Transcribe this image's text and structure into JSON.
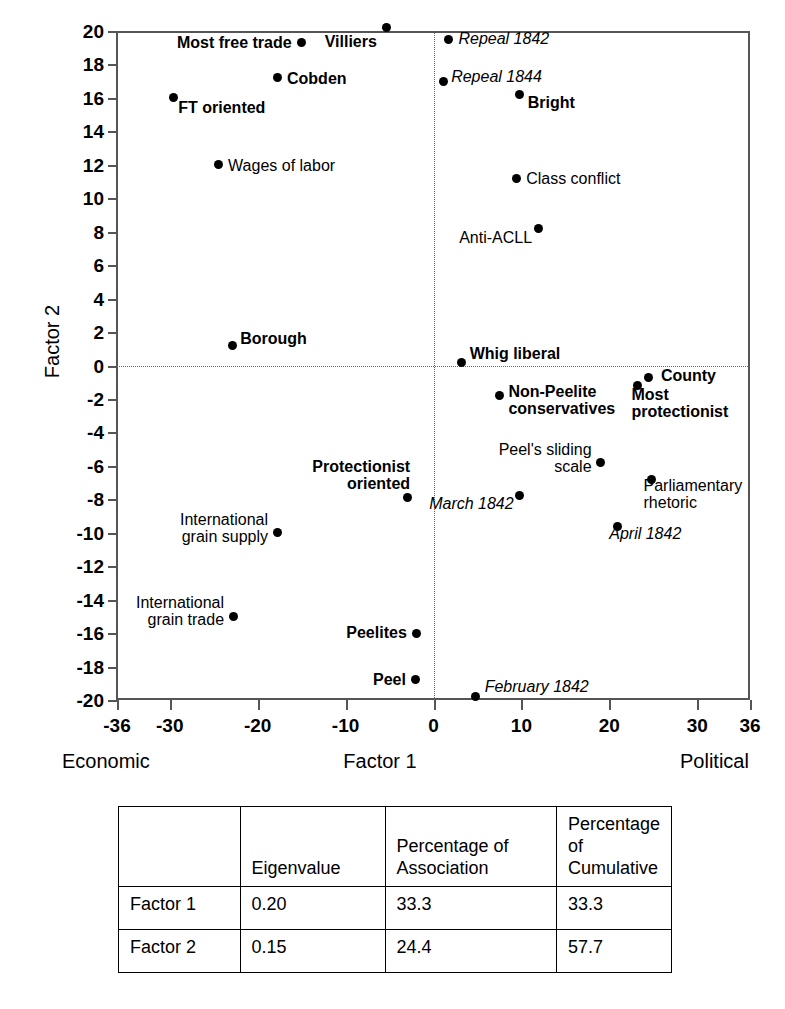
{
  "chart_data": {
    "type": "scatter",
    "title": "",
    "xlabel": "Factor 1",
    "ylabel": "Factor 2",
    "xlim": [
      -36,
      36
    ],
    "ylim": [
      -20,
      20
    ],
    "x_axis_left_pole": "Economic",
    "x_axis_right_pole": "Political",
    "xticks": [
      -36,
      -30,
      -20,
      -10,
      0,
      10,
      20,
      30,
      36
    ],
    "yticks": [
      20,
      18,
      16,
      14,
      12,
      10,
      8,
      6,
      4,
      2,
      0,
      -2,
      -4,
      -6,
      -8,
      -10,
      -12,
      -14,
      -16,
      -18,
      -20
    ],
    "grid": false,
    "reference_lines": {
      "horizontal": 0,
      "vertical": 0
    },
    "legend": "none",
    "points": [
      {
        "label": "Most free trade",
        "x": -15.0,
        "y": 19.3,
        "style": "bold",
        "align": "right",
        "dx": -10,
        "dy": -1
      },
      {
        "label": "Villiers",
        "x": -5.3,
        "y": 20.2,
        "style": "bold",
        "align": "right",
        "dx": -10,
        "dy": 13
      },
      {
        "label": "Repeal 1842",
        "x": 1.7,
        "y": 19.5,
        "style": "italic",
        "align": "left",
        "dx": 10,
        "dy": -1
      },
      {
        "label": "Cobden",
        "x": -17.8,
        "y": 17.2,
        "style": "bold",
        "align": "left",
        "dx": 10,
        "dy": 0
      },
      {
        "label": "Repeal 1844",
        "x": 1.1,
        "y": 17.0,
        "style": "italic",
        "align": "left",
        "dx": 8,
        "dy": -5
      },
      {
        "label": "Bright",
        "x": 9.8,
        "y": 16.2,
        "style": "bold",
        "align": "left",
        "dx": 8,
        "dy": 7
      },
      {
        "label": "FT oriented",
        "x": -29.6,
        "y": 16.0,
        "style": "bold",
        "align": "left",
        "dx": 5,
        "dy": 9
      },
      {
        "label": "Wages of labor",
        "x": -24.5,
        "y": 12.0,
        "style": "plain",
        "align": "left",
        "dx": 10,
        "dy": 0
      },
      {
        "label": "Class conflict",
        "x": 9.4,
        "y": 11.2,
        "style": "plain",
        "align": "left",
        "dx": 10,
        "dy": 0
      },
      {
        "label": "Anti-ACLL",
        "x": 11.9,
        "y": 8.2,
        "style": "plain",
        "align": "right",
        "dx": -6,
        "dy": 9
      },
      {
        "label": "Borough",
        "x": -22.9,
        "y": 1.2,
        "style": "bold",
        "align": "left",
        "dx": 8,
        "dy": -7
      },
      {
        "label": "Whig liberal",
        "x": 3.2,
        "y": 0.2,
        "style": "bold",
        "align": "left",
        "dx": 8,
        "dy": -9
      },
      {
        "label": "County",
        "x": 24.5,
        "y": -0.7,
        "style": "bold",
        "align": "left",
        "dx": 12,
        "dy": -2
      },
      {
        "label": "Most\nprotectionist",
        "x": 23.2,
        "y": -1.2,
        "style": "bold",
        "align": "left",
        "dx": -6,
        "dy": 8
      },
      {
        "label": "Non-Peelite\nconservatives",
        "x": 7.5,
        "y": -1.8,
        "style": "bold",
        "align": "left",
        "dx": 9,
        "dy": -5
      },
      {
        "label": "Peel's sliding\nscale",
        "x": 19.0,
        "y": -5.8,
        "style": "plain",
        "align": "right",
        "dx": -9,
        "dy": -14
      },
      {
        "label": "Protectionist\noriented",
        "x": -3.0,
        "y": -7.9,
        "style": "bold",
        "align": "right",
        "dx": 3,
        "dy": -32
      },
      {
        "label": "Parliamentary\nrhetoric",
        "x": 24.8,
        "y": -6.8,
        "style": "plain",
        "align": "left",
        "dx": -8,
        "dy": 6
      },
      {
        "label": "March 1842",
        "x": 9.8,
        "y": -7.8,
        "style": "italic",
        "align": "right",
        "dx": -6,
        "dy": 7
      },
      {
        "label": "April 1842",
        "x": 20.9,
        "y": -9.6,
        "style": "italic",
        "align": "left",
        "dx": -8,
        "dy": 7
      },
      {
        "label": "International\ngrain supply",
        "x": -17.8,
        "y": -10.0,
        "style": "plain",
        "align": "right",
        "dx": -9,
        "dy": -14
      },
      {
        "label": "International\ngrain trade",
        "x": -22.8,
        "y": -15.0,
        "style": "plain",
        "align": "right",
        "dx": -9,
        "dy": -14
      },
      {
        "label": "Peelites",
        "x": -1.9,
        "y": -16.0,
        "style": "bold",
        "align": "right",
        "dx": -10,
        "dy": -1
      },
      {
        "label": "Peel",
        "x": -2.0,
        "y": -18.8,
        "style": "bold",
        "align": "right",
        "dx": -10,
        "dy": -1
      },
      {
        "label": "February 1842",
        "x": 4.8,
        "y": -19.8,
        "style": "italic",
        "align": "left",
        "dx": 9,
        "dy": -11
      }
    ]
  },
  "table": {
    "headers": [
      "",
      "Eigenvalue",
      "Percentage of\nAssociation",
      "Percentage of\nCumulative"
    ],
    "rows": [
      {
        "label": "Factor 1",
        "eigenvalue": "0.20",
        "association": "33.3",
        "cumulative": "33.3"
      },
      {
        "label": "Factor 2",
        "eigenvalue": "0.15",
        "association": "24.4",
        "cumulative": "57.7"
      }
    ]
  },
  "colors": {
    "point": "#000000",
    "axis": "#555555",
    "reference_line": "#666666",
    "background": "#ffffff"
  }
}
